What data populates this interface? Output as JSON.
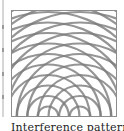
{
  "figure": {
    "caption": "Interference pattern",
    "width": 106,
    "height": 107,
    "border_color": "#8c8c8c",
    "stroke_color": "#7a7a7a",
    "stroke_width": 2.2,
    "sources": [
      {
        "cx": 37,
        "cy": 107
      },
      {
        "cx": 69,
        "cy": 107
      }
    ],
    "ring_spacing": 10.5,
    "ring_count": 12
  },
  "left_neighbor": {
    "ticks_y": [
      25,
      48,
      72,
      95
    ]
  }
}
